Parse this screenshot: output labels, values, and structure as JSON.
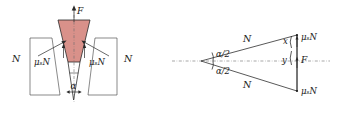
{
  "figure": {
    "background_color": "#ffffff",
    "wedge_fill_color": "#d9918a",
    "wedge_stroke_color": "#2a2a2a",
    "line_color": "#3a3a3a",
    "axis_color": "#6b6b6b",
    "text_color": "#1a1a1a"
  },
  "left_diagram": {
    "name": "wedge-in-slot-front-view",
    "labels": {
      "applied_force": "F",
      "normal_left": "N",
      "normal_right": "N",
      "friction_left": "μₛN",
      "friction_right": "μₛN",
      "wedge_angle": "α"
    }
  },
  "right_diagram": {
    "name": "wedge-side-view",
    "labels": {
      "normal_top": "N",
      "normal_bottom": "N",
      "half_angle_top": "α/2",
      "half_angle_bottom": "α/2",
      "component_x": "x",
      "component_y": "y",
      "applied_force": "F",
      "friction_top": "μₛN",
      "friction_bottom": "μₛN"
    }
  }
}
